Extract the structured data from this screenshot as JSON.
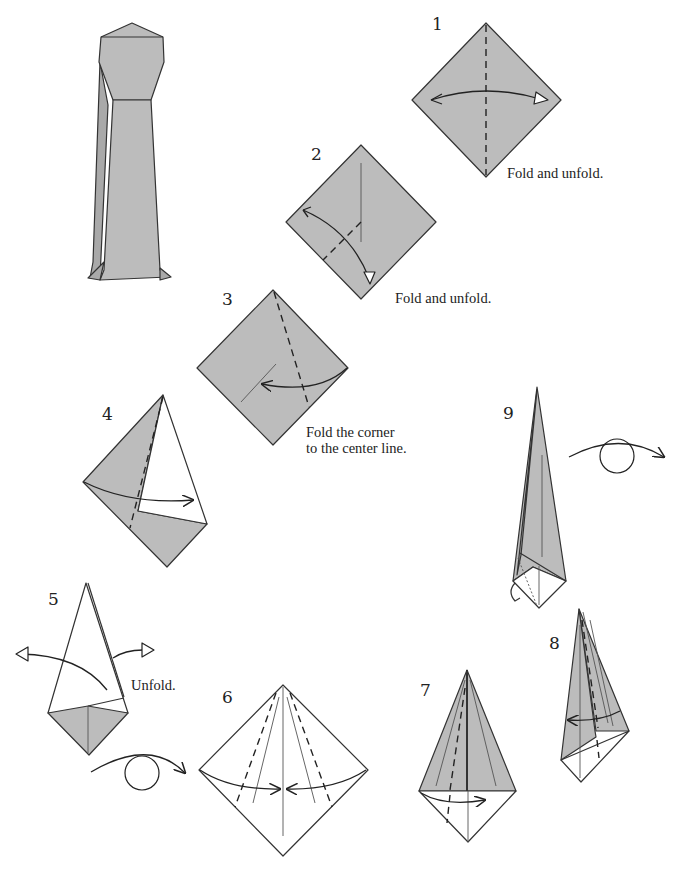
{
  "diagram": {
    "colors": {
      "paper": "#bcbcbc",
      "paper_shadow": "#a9a9a9",
      "line": "#333333",
      "background": "#ffffff"
    },
    "steps": [
      {
        "number": "1",
        "caption": [
          "Fold and unfold."
        ]
      },
      {
        "number": "2",
        "caption": [
          "Fold and unfold."
        ]
      },
      {
        "number": "3",
        "caption": [
          "Fold the corner",
          "to the center line."
        ]
      },
      {
        "number": "4",
        "caption": []
      },
      {
        "number": "5",
        "caption": [
          "Unfold."
        ]
      },
      {
        "number": "6",
        "caption": []
      },
      {
        "number": "7",
        "caption": []
      },
      {
        "number": "8",
        "caption": []
      },
      {
        "number": "9",
        "caption": []
      }
    ],
    "symbols": {
      "turn_over": "turn-over-icon",
      "fold_unfold": "fold-and-unfold-arrow-icon",
      "valley_fold": "valley-fold-line",
      "fold_arrow": "fold-arrow-icon"
    },
    "finished_model": "tower"
  }
}
